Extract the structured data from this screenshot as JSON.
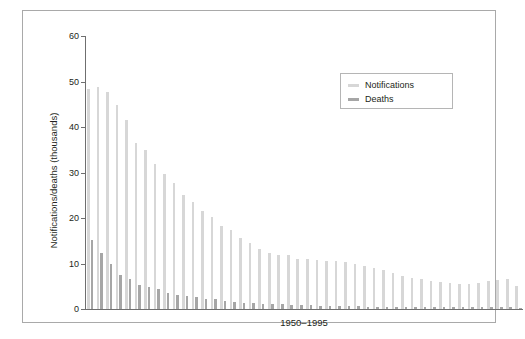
{
  "chart_data": {
    "type": "bar",
    "title": "",
    "xlabel": "1950–1995",
    "ylabel": "Notifications/deaths (thousands)",
    "ylim": [
      0,
      60
    ],
    "yticks": [
      0,
      10,
      20,
      30,
      40,
      50,
      60
    ],
    "grid": false,
    "legend_position": "top-right",
    "categories": [
      "1950",
      "1951",
      "1952",
      "1953",
      "1954",
      "1955",
      "1956",
      "1957",
      "1958",
      "1959",
      "1960",
      "1961",
      "1962",
      "1963",
      "1964",
      "1965",
      "1966",
      "1967",
      "1968",
      "1969",
      "1970",
      "1971",
      "1972",
      "1973",
      "1974",
      "1975",
      "1976",
      "1977",
      "1978",
      "1979",
      "1980",
      "1981",
      "1982",
      "1983",
      "1984",
      "1985",
      "1986",
      "1987",
      "1988",
      "1989",
      "1990",
      "1991",
      "1992",
      "1993",
      "1994",
      "1995"
    ],
    "series": [
      {
        "name": "Notifications",
        "color": "#d7d7d7",
        "values": [
          48.3,
          48.8,
          47.6,
          44.9,
          41.5,
          36.5,
          35.0,
          31.8,
          29.7,
          27.6,
          25.0,
          23.5,
          21.6,
          20.2,
          18.2,
          17.4,
          15.5,
          14.6,
          13.3,
          12.3,
          11.9,
          11.8,
          11.1,
          10.9,
          10.7,
          10.6,
          10.6,
          10.3,
          9.9,
          9.5,
          9.1,
          8.5,
          7.9,
          7.3,
          6.9,
          6.5,
          6.2,
          5.9,
          5.7,
          5.6,
          5.5,
          5.8,
          6.1,
          6.4,
          6.5,
          5.0
        ]
      },
      {
        "name": "Deaths",
        "color": "#a6a6a6",
        "values": [
          15.1,
          12.4,
          10.0,
          7.5,
          6.5,
          5.2,
          4.8,
          4.3,
          3.6,
          3.0,
          2.8,
          2.6,
          2.3,
          2.1,
          1.8,
          1.6,
          1.4,
          1.3,
          1.2,
          1.1,
          1.0,
          0.9,
          0.8,
          0.8,
          0.7,
          0.7,
          0.6,
          0.6,
          0.6,
          0.5,
          0.5,
          0.5,
          0.5,
          0.4,
          0.4,
          0.4,
          0.4,
          0.4,
          0.4,
          0.4,
          0.4,
          0.4,
          0.4,
          0.4,
          0.4,
          0.3
        ]
      }
    ]
  },
  "legend": {
    "items": [
      {
        "label": "Notifications",
        "swatch": "notif"
      },
      {
        "label": "Deaths",
        "swatch": "death"
      }
    ]
  }
}
